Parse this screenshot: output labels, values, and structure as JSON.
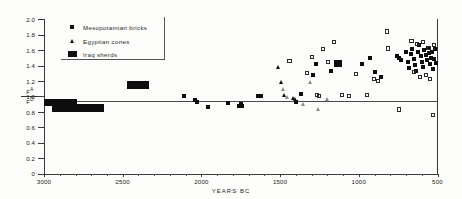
{
  "chart_data": {
    "type": "scatter",
    "title": "",
    "xlabel": "YEARS  BC",
    "ylabel": "F A / F D",
    "ylabel_numerator": "F",
    "ylabel_numerator_sup": "A",
    "ylabel_denominator": "F",
    "ylabel_denominator_sup": "D",
    "xlim": [
      3000,
      500
    ],
    "ylim": [
      0,
      2.0
    ],
    "x_reversed": true,
    "grid": false,
    "reference_line_y": 1.0,
    "xticks": [
      3000,
      2500,
      2000,
      1500,
      1000,
      500
    ],
    "xtick_labels": [
      "3000",
      "2500",
      "2000",
      "1500",
      "1000",
      "500"
    ],
    "yticks": [
      0,
      0.2,
      0.4,
      0.6,
      0.8,
      1.0,
      1.2,
      1.4,
      1.6,
      1.8,
      2.0
    ],
    "ytick_labels": [
      "0",
      "0.2",
      "0.4",
      "0.6",
      "0.8",
      "1.0",
      "1.2",
      "1.4",
      "1.6",
      "1.8",
      "2.0"
    ],
    "legend_position": "top-left",
    "series": [
      {
        "name": "Mesopotamian bricks",
        "marker": "filled-square",
        "points": [
          [
            2430,
            1.15
          ],
          [
            2390,
            1.15
          ],
          [
            2110,
            1.0
          ],
          [
            2040,
            0.95
          ],
          [
            2030,
            0.93
          ],
          [
            1960,
            0.86
          ],
          [
            1830,
            0.92
          ],
          [
            1760,
            0.88
          ],
          [
            1750,
            0.9
          ],
          [
            1745,
            0.87
          ],
          [
            1640,
            1.01
          ],
          [
            1620,
            1.0
          ],
          [
            1400,
            0.93
          ],
          [
            1370,
            1.03
          ],
          [
            1290,
            1.28
          ],
          [
            1270,
            1.42
          ],
          [
            1180,
            1.33
          ],
          [
            1130,
            1.44
          ],
          [
            980,
            1.42
          ],
          [
            930,
            1.5
          ],
          [
            900,
            1.31
          ],
          [
            860,
            1.25
          ],
          [
            760,
            1.52
          ],
          [
            745,
            1.5
          ],
          [
            735,
            1.47
          ],
          [
            700,
            1.58
          ],
          [
            690,
            1.44
          ],
          [
            680,
            1.37
          ],
          [
            670,
            1.55
          ],
          [
            660,
            1.62
          ],
          [
            650,
            1.49
          ],
          [
            645,
            1.41
          ],
          [
            635,
            1.33
          ],
          [
            625,
            1.57
          ],
          [
            615,
            1.66
          ],
          [
            605,
            1.52
          ],
          [
            600,
            1.45
          ],
          [
            595,
            1.38
          ],
          [
            585,
            1.6
          ],
          [
            575,
            1.54
          ],
          [
            570,
            1.47
          ],
          [
            560,
            1.63
          ],
          [
            555,
            1.56
          ],
          [
            548,
            1.42
          ],
          [
            540,
            1.5
          ],
          [
            533,
            1.58
          ],
          [
            527,
            1.35
          ],
          [
            520,
            1.48
          ],
          [
            515,
            1.61
          ],
          [
            510,
            1.43
          ]
        ]
      },
      {
        "name": "Egyptian cones",
        "marker": "triangle",
        "points_filled": [
          [
            1510,
            1.38
          ],
          [
            1495,
            1.18
          ],
          [
            1470,
            1.02
          ],
          [
            1415,
            0.98
          ],
          [
            1400,
            0.96
          ]
        ],
        "points_open": [
          [
            1480,
            1.09
          ],
          [
            1455,
            0.99
          ],
          [
            1350,
            0.9
          ],
          [
            1305,
            1.18
          ],
          [
            1260,
            0.83
          ],
          [
            1200,
            0.96
          ]
        ]
      },
      {
        "name": "Iraq sherds",
        "marker": "filled-bar",
        "bars": [
          {
            "x_start": 3000,
            "x_end": 2790,
            "y_low": 0.87,
            "y_high": 0.97
          },
          {
            "x_start": 2950,
            "x_end": 2620,
            "y_low": 0.8,
            "y_high": 0.9
          },
          {
            "x_start": 2470,
            "x_end": 2330,
            "y_low": 1.1,
            "y_high": 1.2
          },
          {
            "x_start": 1160,
            "x_end": 1105,
            "y_low": 1.38,
            "y_high": 1.47
          }
        ]
      },
      {
        "name": "open squares",
        "marker": "open-square",
        "points": [
          [
            1440,
            1.46
          ],
          [
            1330,
            1.3
          ],
          [
            1300,
            1.51
          ],
          [
            1265,
            1.02
          ],
          [
            1250,
            1.01
          ],
          [
            1225,
            1.61
          ],
          [
            1195,
            1.44
          ],
          [
            1160,
            1.7
          ],
          [
            1105,
            1.02
          ],
          [
            1060,
            1.0
          ],
          [
            1020,
            1.29
          ],
          [
            950,
            1.02
          ],
          [
            905,
            1.22
          ],
          [
            880,
            1.2
          ],
          [
            820,
            1.84
          ],
          [
            815,
            1.62
          ],
          [
            745,
            0.83
          ],
          [
            665,
            1.72
          ],
          [
            648,
            1.31
          ],
          [
            630,
            1.68
          ],
          [
            612,
            1.25
          ],
          [
            590,
            1.7
          ],
          [
            572,
            1.28
          ],
          [
            556,
            1.63
          ],
          [
            545,
            1.22
          ],
          [
            530,
            0.76
          ],
          [
            522,
            1.66
          ]
        ]
      }
    ],
    "legend_entries": [
      {
        "label": "Mesopotamian bricks",
        "marker": "filled-square"
      },
      {
        "label": "Egyptian cones",
        "marker": "filled-triangle"
      },
      {
        "label": "Iraq sherds",
        "marker": "filled-bar"
      }
    ]
  }
}
